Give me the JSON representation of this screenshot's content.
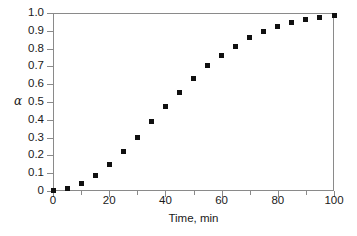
{
  "chart_data": {
    "type": "scatter",
    "title": "",
    "xlabel": "Time, min",
    "ylabel": "α",
    "xlim": [
      0,
      100
    ],
    "ylim": [
      0,
      1.0
    ],
    "grid": false,
    "legend": null,
    "marker": "filled-square",
    "marker_color": "#101010",
    "frame_color": "#8a8a8a",
    "x_ticks": [
      0,
      20,
      40,
      60,
      80,
      100
    ],
    "x_tick_labels": [
      "0",
      "20",
      "40",
      "60",
      "80",
      "100"
    ],
    "x_minor_ticks": [
      10,
      30,
      50,
      70,
      90
    ],
    "y_ticks": [
      0,
      0.1,
      0.2,
      0.3,
      0.4,
      0.5,
      0.6,
      0.7,
      0.8,
      0.9,
      1.0
    ],
    "y_tick_labels": [
      "0",
      "0.1",
      "0.2",
      "0.3",
      "0.4",
      "0.5",
      "0.6",
      "0.7",
      "0.8",
      "0.9",
      "1.0"
    ],
    "x": [
      0,
      5,
      10,
      15,
      20,
      25,
      30,
      35,
      40,
      45,
      50,
      55,
      60,
      65,
      70,
      75,
      80,
      85,
      90,
      95,
      100
    ],
    "values": [
      0.005,
      0.012,
      0.04,
      0.086,
      0.148,
      0.221,
      0.303,
      0.391,
      0.475,
      0.556,
      0.632,
      0.704,
      0.761,
      0.813,
      0.861,
      0.895,
      0.925,
      0.945,
      0.963,
      0.974,
      0.986
    ]
  }
}
